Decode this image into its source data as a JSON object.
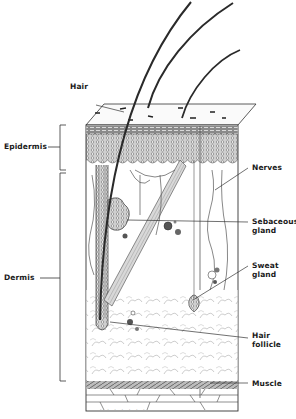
{
  "diagram": {
    "style": "pencil illustration, black and white",
    "labels": {
      "hair": "Hair",
      "epidermis": "Epidermis",
      "dermis": "Dermis",
      "nerves": "Nerves",
      "sebaceous_gland_line1": "Sebaceous",
      "sebaceous_gland_line2": "gland",
      "sweat_gland_line1": "Sweat",
      "sweat_gland_line2": "gland",
      "hair_follicle_line1": "Hair",
      "hair_follicle_line2": "follicle",
      "muscle": "Muscle"
    },
    "caption": "· · · · · · ·",
    "colors": {
      "ink": "#1a1a1a",
      "shade": "#555555",
      "light": "#9a9a9a",
      "paper": "#ffffff"
    }
  }
}
